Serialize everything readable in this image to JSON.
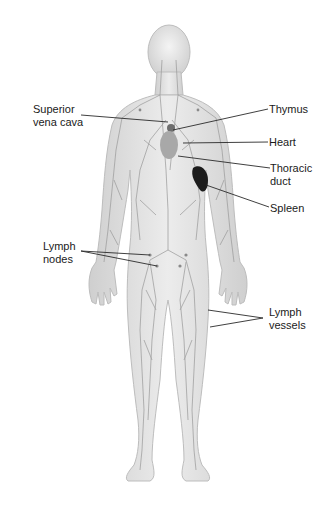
{
  "diagram": {
    "labels": {
      "superior_vena_cava_line1": "Superior",
      "superior_vena_cava_line2": "vena cava",
      "thymus": "Thymus",
      "heart": "Heart",
      "thoracic_duct_line1": "Thoracic",
      "thoracic_duct_line2": "duct",
      "spleen": "Spleen",
      "lymph_nodes_line1": "Lymph",
      "lymph_nodes_line2": "nodes",
      "lymph_vessels_line1": "Lymph",
      "lymph_vessels_line2": "vessels"
    },
    "colors": {
      "body_fill": "#d9d9d9",
      "body_edge": "#b5b5b5",
      "vessel": "#9a9a9a",
      "spleen": "#1c1c1c",
      "heart": "#a8a8a8",
      "leader_line": "#2a2a2a",
      "text": "#1a1a1a"
    }
  }
}
